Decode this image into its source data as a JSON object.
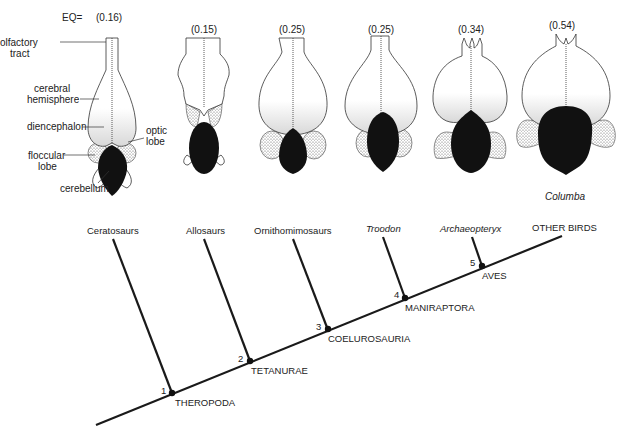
{
  "brains": {
    "eq_prefix": "EQ=",
    "items": [
      {
        "eq": "(0.16)",
        "taxon": "Ceratosaur"
      },
      {
        "eq": "(0.15)",
        "taxon": "Allosaur"
      },
      {
        "eq": "(0.25)",
        "taxon": "Ornithomimosaur"
      },
      {
        "eq": "(0.25)",
        "taxon": "Troodon"
      },
      {
        "eq": "(0.34)",
        "taxon": "Archaeopteryx"
      },
      {
        "eq": "(0.54)",
        "taxon": "Columba"
      }
    ],
    "anatomy_labels": {
      "olfactory_1": "olfactory",
      "olfactory_2": "tract",
      "cerebral_1": "cerebral",
      "cerebral_2": "hemisphere",
      "diencephalon": "diencephalon",
      "optic_1": "optic",
      "optic_2": "lobe",
      "floccular_1": "floccular",
      "floccular_2": "lobe",
      "cerebellum": "cerebellum"
    },
    "columba_label": "Columba"
  },
  "cladogram": {
    "tips": [
      {
        "label": "Ceratosaurs",
        "italic": false
      },
      {
        "label": "Allosaurs",
        "italic": false
      },
      {
        "label": "Ornithomimosaurs",
        "italic": false
      },
      {
        "label": "Troodon",
        "italic": true
      },
      {
        "label": "Archaeopteryx",
        "italic": true
      },
      {
        "label": "OTHER BIRDS",
        "italic": false
      }
    ],
    "nodes": [
      {
        "number": "1",
        "clade": "THEROPODA"
      },
      {
        "number": "2",
        "clade": "TETANURAE"
      },
      {
        "number": "3",
        "clade": "COELUROSAURIA"
      },
      {
        "number": "4",
        "clade": "MANIRAPTORA"
      },
      {
        "number": "5",
        "clade": "AVES"
      }
    ]
  }
}
